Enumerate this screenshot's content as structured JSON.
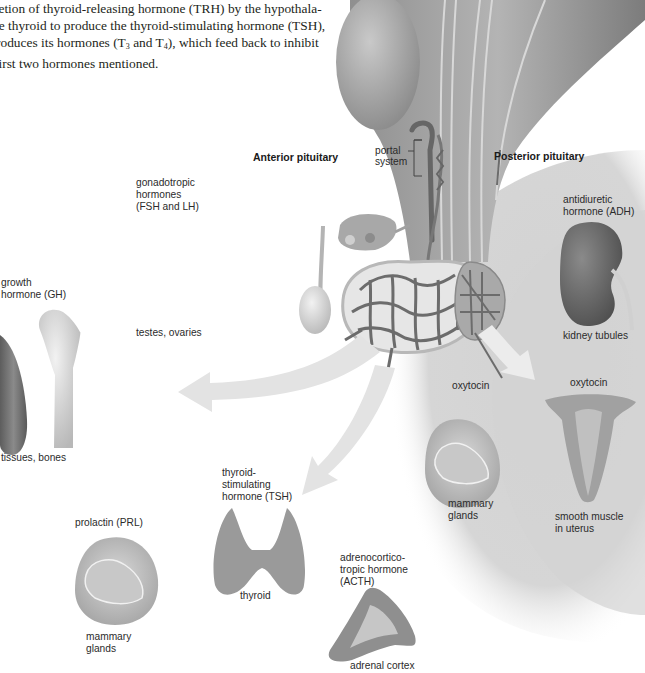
{
  "intro_text": {
    "line1": "retion of thyroid-releasing hormone (TRH) by the hypothala-",
    "line2": "he thyroid to produce the thyroid-stimulating hormone (TSH),",
    "line3_pre": "roduces its hormones (T",
    "line3_sub1": "3",
    "line3_mid": " and T",
    "line3_sub2": "4",
    "line3_post": "), which feed back to inhibit",
    "line4": " first two hormones mentioned."
  },
  "regions": {
    "anterior": "Anterior pituitary",
    "posterior": "Posterior pituitary",
    "portal_line1": "portal",
    "portal_line2": "system"
  },
  "anterior_targets": [
    {
      "hormone": [
        "gonadotropic",
        "hormones",
        "(FSH and LH)"
      ],
      "target": [
        "testes, ovaries"
      ]
    },
    {
      "hormone": [
        "growth",
        "hormone (GH)"
      ],
      "target": [
        "tissues, bones"
      ]
    },
    {
      "hormone": [
        "thyroid-",
        "stimulating",
        "hormone (TSH)"
      ],
      "target": [
        "thyroid"
      ]
    },
    {
      "hormone": [
        "prolactin (PRL)"
      ],
      "target": [
        "mammary",
        "glands"
      ]
    },
    {
      "hormone": [
        "adrenocortico-",
        "tropic hormone",
        "(ACTH)"
      ],
      "target": [
        "adrenal cortex"
      ]
    }
  ],
  "posterior_targets": [
    {
      "hormone": [
        "antidiuretic",
        "hormone (ADH)"
      ],
      "target": [
        "kidney tubules"
      ]
    },
    {
      "hormone": [
        "oxytocin"
      ],
      "target": [
        "mammary",
        "glands"
      ]
    },
    {
      "hormone": [
        "oxytocin"
      ],
      "target": [
        "smooth muscle",
        "in uterus"
      ]
    }
  ],
  "colors": {
    "background": "#ffffff",
    "posterior_shade": "#d9d9d9",
    "arrow": "#e4e4e4",
    "tissue_gray": "#9a9a9a",
    "vessel": "#6e6e6e",
    "text": "#2b2b2b"
  }
}
